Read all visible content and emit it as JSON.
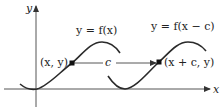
{
  "diagram": {
    "axes": {
      "x_label": "x",
      "y_label": "y"
    },
    "curves": [
      {
        "id": "original",
        "label": "y = f(x)"
      },
      {
        "id": "shifted",
        "label": "y = f(x − c)"
      }
    ],
    "points": [
      {
        "id": "p1",
        "label": "(x, y)"
      },
      {
        "id": "p2",
        "label": "(x + c, y)"
      }
    ],
    "shift": {
      "label": "c"
    },
    "colors": {
      "curve": "#2a2a2a",
      "axis": "#555555",
      "text": "#222222"
    }
  }
}
